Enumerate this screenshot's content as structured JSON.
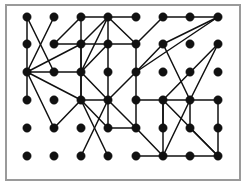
{
  "figure": {
    "width": 247,
    "height": 186,
    "background_color": "#ffffff"
  },
  "frame": {
    "name": "plot-border",
    "x": 6,
    "y": 5,
    "width": 234,
    "height": 175,
    "stroke_color": "#9a9a9a",
    "stroke_width": 2,
    "fill_color": "#ffffff"
  },
  "style": {
    "node_color": "#111111",
    "node_radius": 4.2,
    "edge_color": "#101010",
    "edge_width": 1.5
  },
  "chart_data": {
    "type": "scatter",
    "xlabel": "",
    "ylabel": "",
    "grid": false,
    "legend": null,
    "xlim": [
      0,
      247
    ],
    "ylim": [
      0,
      186
    ],
    "node_count": 48,
    "edge_count": 62,
    "rows": 6,
    "columns": 8,
    "row_y": [
      17,
      44,
      72,
      100,
      128,
      156
    ],
    "column_x": [
      27,
      54,
      81,
      108,
      136,
      163,
      190,
      218
    ],
    "nodes": [
      {
        "id": "r1c1",
        "row": 1,
        "col": 1,
        "x": 27,
        "y": 17
      },
      {
        "id": "r1c2",
        "row": 1,
        "col": 2,
        "x": 54,
        "y": 17
      },
      {
        "id": "r1c3",
        "row": 1,
        "col": 3,
        "x": 81,
        "y": 17
      },
      {
        "id": "r1c4",
        "row": 1,
        "col": 4,
        "x": 108,
        "y": 17
      },
      {
        "id": "r1c5",
        "row": 1,
        "col": 5,
        "x": 136,
        "y": 17
      },
      {
        "id": "r1c6",
        "row": 1,
        "col": 6,
        "x": 163,
        "y": 17
      },
      {
        "id": "r1c7",
        "row": 1,
        "col": 7,
        "x": 190,
        "y": 17
      },
      {
        "id": "r1c8",
        "row": 1,
        "col": 8,
        "x": 218,
        "y": 17
      },
      {
        "id": "r2c1",
        "row": 2,
        "col": 1,
        "x": 27,
        "y": 44
      },
      {
        "id": "r2c2",
        "row": 2,
        "col": 2,
        "x": 54,
        "y": 44
      },
      {
        "id": "r2c3",
        "row": 2,
        "col": 3,
        "x": 81,
        "y": 44
      },
      {
        "id": "r2c4",
        "row": 2,
        "col": 4,
        "x": 108,
        "y": 44
      },
      {
        "id": "r2c5",
        "row": 2,
        "col": 5,
        "x": 136,
        "y": 44
      },
      {
        "id": "r2c6",
        "row": 2,
        "col": 6,
        "x": 163,
        "y": 44
      },
      {
        "id": "r2c7",
        "row": 2,
        "col": 7,
        "x": 190,
        "y": 44
      },
      {
        "id": "r2c8",
        "row": 2,
        "col": 8,
        "x": 218,
        "y": 44
      },
      {
        "id": "r3c1",
        "row": 3,
        "col": 1,
        "x": 27,
        "y": 72
      },
      {
        "id": "r3c2",
        "row": 3,
        "col": 2,
        "x": 54,
        "y": 72
      },
      {
        "id": "r3c3",
        "row": 3,
        "col": 3,
        "x": 81,
        "y": 72
      },
      {
        "id": "r3c4",
        "row": 3,
        "col": 4,
        "x": 108,
        "y": 72
      },
      {
        "id": "r3c5",
        "row": 3,
        "col": 5,
        "x": 136,
        "y": 72
      },
      {
        "id": "r3c6",
        "row": 3,
        "col": 6,
        "x": 163,
        "y": 72
      },
      {
        "id": "r3c7",
        "row": 3,
        "col": 7,
        "x": 190,
        "y": 72
      },
      {
        "id": "r3c8",
        "row": 3,
        "col": 8,
        "x": 218,
        "y": 72
      },
      {
        "id": "r4c1",
        "row": 4,
        "col": 1,
        "x": 27,
        "y": 100
      },
      {
        "id": "r4c2",
        "row": 4,
        "col": 2,
        "x": 54,
        "y": 100
      },
      {
        "id": "r4c3",
        "row": 4,
        "col": 3,
        "x": 81,
        "y": 100
      },
      {
        "id": "r4c4",
        "row": 4,
        "col": 4,
        "x": 108,
        "y": 100
      },
      {
        "id": "r4c5",
        "row": 4,
        "col": 5,
        "x": 136,
        "y": 100
      },
      {
        "id": "r4c6",
        "row": 4,
        "col": 6,
        "x": 163,
        "y": 100
      },
      {
        "id": "r4c7",
        "row": 4,
        "col": 7,
        "x": 190,
        "y": 100
      },
      {
        "id": "r4c8",
        "row": 4,
        "col": 8,
        "x": 218,
        "y": 100
      },
      {
        "id": "r5c1",
        "row": 5,
        "col": 1,
        "x": 27,
        "y": 128
      },
      {
        "id": "r5c2",
        "row": 5,
        "col": 2,
        "x": 54,
        "y": 128
      },
      {
        "id": "r5c3",
        "row": 5,
        "col": 3,
        "x": 81,
        "y": 128
      },
      {
        "id": "r5c4",
        "row": 5,
        "col": 4,
        "x": 108,
        "y": 128
      },
      {
        "id": "r5c5",
        "row": 5,
        "col": 5,
        "x": 136,
        "y": 128
      },
      {
        "id": "r5c6",
        "row": 5,
        "col": 6,
        "x": 163,
        "y": 128
      },
      {
        "id": "r5c7",
        "row": 5,
        "col": 7,
        "x": 190,
        "y": 128
      },
      {
        "id": "r5c8",
        "row": 5,
        "col": 8,
        "x": 218,
        "y": 128
      },
      {
        "id": "r6c1",
        "row": 6,
        "col": 1,
        "x": 27,
        "y": 156
      },
      {
        "id": "r6c2",
        "row": 6,
        "col": 2,
        "x": 54,
        "y": 156
      },
      {
        "id": "r6c3",
        "row": 6,
        "col": 3,
        "x": 81,
        "y": 156
      },
      {
        "id": "r6c4",
        "row": 6,
        "col": 4,
        "x": 108,
        "y": 156
      },
      {
        "id": "r6c5",
        "row": 6,
        "col": 5,
        "x": 136,
        "y": 156
      },
      {
        "id": "r6c6",
        "row": 6,
        "col": 6,
        "x": 163,
        "y": 156
      },
      {
        "id": "r6c7",
        "row": 6,
        "col": 7,
        "x": 190,
        "y": 156
      },
      {
        "id": "r6c8",
        "row": 6,
        "col": 8,
        "x": 218,
        "y": 156
      }
    ],
    "edges": [
      [
        "r1c1",
        "r2c1"
      ],
      [
        "r1c1",
        "r3c2"
      ],
      [
        "r1c2",
        "r3c1"
      ],
      [
        "r1c3",
        "r2c3"
      ],
      [
        "r1c3",
        "r1c4"
      ],
      [
        "r1c4",
        "r1c5"
      ],
      [
        "r1c4",
        "r2c5"
      ],
      [
        "r1c4",
        "r3c3"
      ],
      [
        "r1c4",
        "r4c4"
      ],
      [
        "r1c4",
        "r2c3"
      ],
      [
        "r1c6",
        "r1c7"
      ],
      [
        "r1c7",
        "r1c8"
      ],
      [
        "r1c6",
        "r2c5"
      ],
      [
        "r1c8",
        "r3c5"
      ],
      [
        "r1c8",
        "r2c6"
      ],
      [
        "r2c1",
        "r3c1"
      ],
      [
        "r2c2",
        "r2c3"
      ],
      [
        "r2c2",
        "r1c3"
      ],
      [
        "r2c3",
        "r2c4"
      ],
      [
        "r2c3",
        "r3c1"
      ],
      [
        "r2c3",
        "r3c3"
      ],
      [
        "r2c3",
        "r4c3"
      ],
      [
        "r2c4",
        "r3c3"
      ],
      [
        "r2c5",
        "r2c4"
      ],
      [
        "r2c5",
        "r3c5"
      ],
      [
        "r2c6",
        "r3c5"
      ],
      [
        "r2c6",
        "r4c7"
      ],
      [
        "r2c8",
        "r4c6"
      ],
      [
        "r2c8",
        "r4c7"
      ],
      [
        "r3c1",
        "r3c2"
      ],
      [
        "r3c1",
        "r4c1"
      ],
      [
        "r3c1",
        "r4c3"
      ],
      [
        "r3c1",
        "r5c2"
      ],
      [
        "r3c2",
        "r3c3"
      ],
      [
        "r3c3",
        "r4c3"
      ],
      [
        "r3c3",
        "r4c4"
      ],
      [
        "r3c5",
        "r4c5"
      ],
      [
        "r3c5",
        "r4c4"
      ],
      [
        "r4c3",
        "r4c4"
      ],
      [
        "r4c3",
        "r5c2"
      ],
      [
        "r4c3",
        "r5c4"
      ],
      [
        "r4c3",
        "r6c4"
      ],
      [
        "r4c4",
        "r5c4"
      ],
      [
        "r4c4",
        "r5c5"
      ],
      [
        "r4c4",
        "r6c3"
      ],
      [
        "r4c5",
        "r5c5"
      ],
      [
        "r4c5",
        "r4c6"
      ],
      [
        "r4c6",
        "r4c7"
      ],
      [
        "r4c6",
        "r5c6"
      ],
      [
        "r4c6",
        "r6c6"
      ],
      [
        "r4c6",
        "r6c8"
      ],
      [
        "r4c7",
        "r4c8"
      ],
      [
        "r4c7",
        "r5c7"
      ],
      [
        "r4c7",
        "r6c6"
      ],
      [
        "r5c4",
        "r5c5"
      ],
      [
        "r5c5",
        "r6c6"
      ],
      [
        "r5c7",
        "r6c8"
      ],
      [
        "r6c5",
        "r6c6"
      ],
      [
        "r6c6",
        "r6c7"
      ],
      [
        "r6c7",
        "r6c8"
      ],
      [
        "r6c8",
        "r4c8"
      ]
    ]
  }
}
